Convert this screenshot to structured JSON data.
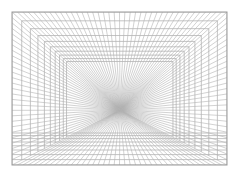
{
  "diagram": {
    "type": "one-point-perspective-grid",
    "canvas": {
      "width": 241,
      "height": 187,
      "background": "#ffffff"
    },
    "frame": {
      "x1": 12,
      "y1": 12,
      "x2": 227,
      "y2": 165
    },
    "vanishing_point": {
      "x": 120,
      "y": 110
    },
    "line_color": "#b4b4b4",
    "frame_color": "#9a9a9a",
    "depth_levels": [
      0,
      0.09,
      0.17,
      0.24,
      0.3,
      0.355,
      0.4,
      0.44,
      0.475,
      0.505
    ],
    "radial_count": 40,
    "floor_y_start": 133,
    "floor_lines": 8
  }
}
